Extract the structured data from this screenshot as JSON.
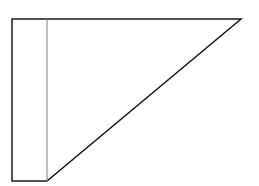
{
  "diagram": {
    "type": "line-drawing",
    "colors": {
      "background": "#ffffff",
      "outline": "#1a1a1a",
      "divider": "#7a7a7a"
    },
    "shapes": {
      "outline": {
        "points": [
          [
            12,
            19
          ],
          [
            241,
            19
          ],
          [
            47,
            181
          ],
          [
            12,
            181
          ]
        ],
        "stroke_width": 1.5
      },
      "divider": {
        "from": [
          47,
          19
        ],
        "to": [
          47,
          181
        ],
        "stroke_width": 1
      }
    }
  }
}
